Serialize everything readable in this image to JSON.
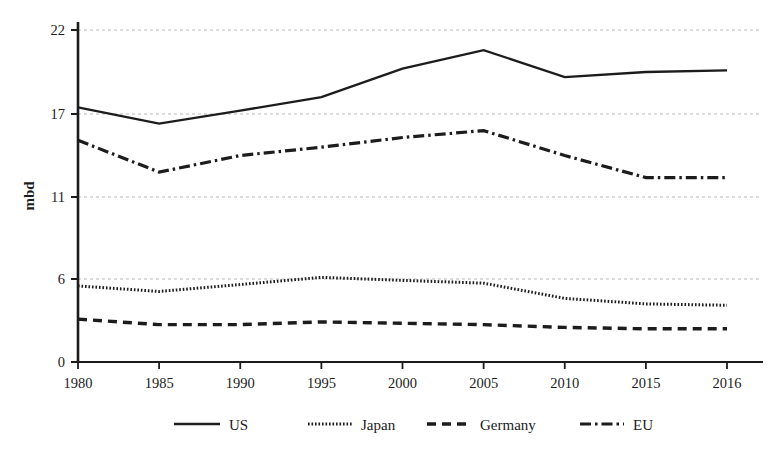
{
  "chart_data": {
    "type": "line",
    "title": "",
    "xlabel": "",
    "ylabel": "mbd",
    "categories": [
      "1980",
      "1985",
      "1990",
      "1995",
      "2000",
      "2005",
      "2010",
      "2015",
      "2016"
    ],
    "x_tick_labels": [
      "1980",
      "1985",
      "1990",
      "1995",
      "2000",
      "2005",
      "2010",
      "2015",
      "2016"
    ],
    "y_tick_labels": [
      "0",
      "6",
      "11",
      "17",
      "22"
    ],
    "y_tick_values": [
      0,
      6,
      11,
      17,
      22
    ],
    "y_axis_spacing": "equal-spaced category ticks",
    "grid": "horizontal dashed gridlines at 6, 11, 17, 22",
    "legend_position": "bottom-center",
    "series": [
      {
        "name": "US",
        "style": "solid",
        "color": "#1c1c1c",
        "values": [
          17.4,
          16.3,
          17.2,
          18.0,
          19.7,
          20.8,
          19.2,
          19.5,
          19.6
        ]
      },
      {
        "name": "Japan",
        "style": "dotted",
        "color": "#1c1c1c",
        "values": [
          5.5,
          5.1,
          5.6,
          6.1,
          5.9,
          5.7,
          4.6,
          4.2,
          4.1
        ]
      },
      {
        "name": "Germany",
        "style": "dashed",
        "color": "#1c1c1c",
        "values": [
          3.1,
          2.7,
          2.7,
          2.9,
          2.8,
          2.7,
          2.5,
          2.4,
          2.4
        ]
      },
      {
        "name": "EU",
        "style": "dash-dot",
        "color": "#1c1c1c",
        "values": [
          15.1,
          12.8,
          14.0,
          14.6,
          15.3,
          15.8,
          14.0,
          12.4,
          12.4
        ]
      }
    ]
  },
  "legend": {
    "items": [
      {
        "label": "US",
        "style": "solid"
      },
      {
        "label": "Japan",
        "style": "dotted"
      },
      {
        "label": "Germany",
        "style": "dashed"
      },
      {
        "label": "EU",
        "style": "dash-dot"
      }
    ]
  },
  "axes": {
    "y_title": "mbd"
  },
  "colors": {
    "ink": "#1c1c1c",
    "grid": "#b9b9b9",
    "background": "#ffffff"
  }
}
